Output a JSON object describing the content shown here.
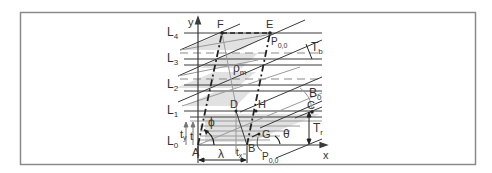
{
  "figure": {
    "frame": {
      "x": 20,
      "y": 12,
      "w": 456,
      "h": 153,
      "stroke": "#8a8a8a"
    },
    "colors": {
      "line": "#3a3a3a",
      "shade": "#dcdcdc",
      "gray_line": "#9a9a9a",
      "text": "#333333"
    },
    "axes": {
      "x_label": "x",
      "y_label": "y"
    },
    "layers": [
      {
        "name": "L4",
        "base": "L",
        "sub": "4",
        "y": 33
      },
      {
        "name": "L3",
        "base": "L",
        "sub": "3",
        "y": 59
      },
      {
        "name": "L2",
        "base": "L",
        "sub": "2",
        "y": 85
      },
      {
        "name": "L1",
        "base": "L",
        "sub": "1",
        "y": 111
      },
      {
        "name": "L0",
        "base": "L",
        "sub": "0",
        "y": 145
      }
    ],
    "points": {
      "A": "A",
      "B": "B",
      "C": "C",
      "D": "D",
      "E": "E",
      "F": "F",
      "G": "G",
      "H": "H"
    },
    "symbols": {
      "phi": "ϕ",
      "theta": "θ",
      "lambda": "λ",
      "rho_m": {
        "base": "ρ",
        "sub": "m"
      },
      "T_b": {
        "base": "T",
        "sub": "b"
      },
      "T_r": {
        "base": "T",
        "sub": "r"
      },
      "B_0": {
        "base": "B",
        "sub": "0"
      },
      "t_y": {
        "base": "t",
        "sub": "y"
      },
      "t": "t",
      "t_x": {
        "base": "t",
        "sub": "x"
      },
      "P00": {
        "base": "P",
        "sub": "0,0"
      },
      "P00_prime": {
        "base": "P",
        "sup": "'",
        "sub": "0,0"
      }
    }
  }
}
